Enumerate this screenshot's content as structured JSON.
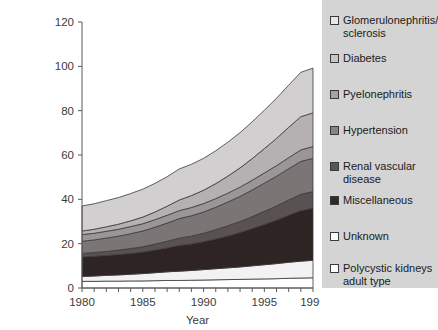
{
  "chart_data": {
    "type": "area",
    "stacked": true,
    "title": "",
    "xlabel": "Year",
    "ylabel": "",
    "xlim": [
      1980,
      1999
    ],
    "ylim": [
      0,
      120
    ],
    "yticks": [
      0,
      20,
      40,
      60,
      80,
      100,
      120
    ],
    "xticks": [
      1980,
      1985,
      1990,
      1995,
      1999
    ],
    "x_minor_ticks_every": 1,
    "grid": false,
    "legend_position": "right",
    "x": [
      1980,
      1981,
      1982,
      1983,
      1984,
      1985,
      1986,
      1987,
      1988,
      1989,
      1990,
      1991,
      1992,
      1993,
      1994,
      1995,
      1996,
      1997,
      1998,
      1999
    ],
    "series": [
      {
        "name": "Polycystic kidneys adult type",
        "color": "#ffffff",
        "values": [
          3.0,
          3.0,
          3.1,
          3.1,
          3.2,
          3.2,
          3.3,
          3.4,
          3.4,
          3.5,
          3.6,
          3.7,
          3.8,
          3.9,
          4.0,
          4.1,
          4.2,
          4.4,
          4.5,
          4.6
        ]
      },
      {
        "name": "Unknown",
        "color": "#f2f2f2",
        "values": [
          2.2,
          2.4,
          2.6,
          2.8,
          3.0,
          3.3,
          3.6,
          3.9,
          4.2,
          4.4,
          4.7,
          5.0,
          5.3,
          5.6,
          6.0,
          6.4,
          6.8,
          7.2,
          7.6,
          7.9
        ]
      },
      {
        "name": "Miscellaneous",
        "color": "#2e2424",
        "values": [
          8.8,
          8.9,
          9.0,
          9.2,
          9.4,
          9.7,
          10.2,
          10.8,
          11.6,
          12.0,
          12.6,
          13.4,
          14.4,
          15.5,
          16.8,
          18.2,
          19.6,
          21.2,
          22.8,
          23.5
        ]
      },
      {
        "name": "Renal vascular disease",
        "color": "#595152",
        "values": [
          1.6,
          1.7,
          1.8,
          2.0,
          2.2,
          2.4,
          2.7,
          3.0,
          3.3,
          3.5,
          3.8,
          4.2,
          4.6,
          5.0,
          5.4,
          5.9,
          6.4,
          6.9,
          7.4,
          7.5
        ]
      },
      {
        "name": "Hypertension",
        "color": "#7c7576",
        "values": [
          5.5,
          5.7,
          6.0,
          6.3,
          6.7,
          7.1,
          7.6,
          8.2,
          8.8,
          9.2,
          9.6,
          10.1,
          10.7,
          11.3,
          12.0,
          12.7,
          13.4,
          14.1,
          14.8,
          15.0
        ]
      },
      {
        "name": "Pyelonephritis",
        "color": "#9a9596",
        "values": [
          3.0,
          3.0,
          3.1,
          3.1,
          3.2,
          3.3,
          3.4,
          3.5,
          3.6,
          3.7,
          3.8,
          3.9,
          4.0,
          4.2,
          4.4,
          4.6,
          4.8,
          5.0,
          5.2,
          5.3
        ]
      },
      {
        "name": "Diabetes",
        "color": "#b5b1b2",
        "values": [
          1.6,
          1.8,
          2.0,
          2.3,
          2.6,
          3.0,
          3.5,
          4.1,
          4.8,
          5.4,
          6.0,
          6.8,
          7.7,
          8.7,
          9.8,
          11.0,
          12.3,
          13.7,
          15.0,
          15.2
        ]
      },
      {
        "name": "Glomerulonephritis/ sclerosis",
        "color": "#d2cfd0",
        "values": [
          11.3,
          11.5,
          11.8,
          12.0,
          12.3,
          12.6,
          12.9,
          13.3,
          14.0,
          14.1,
          14.4,
          14.8,
          15.3,
          15.9,
          16.6,
          17.3,
          18.1,
          19.0,
          20.0,
          20.2
        ]
      }
    ],
    "totals": [
      37.0,
      38.0,
      39.4,
      40.8,
      42.6,
      44.6,
      47.2,
      50.2,
      53.7,
      55.8,
      58.5,
      61.9,
      65.8,
      70.1,
      75.0,
      80.2,
      85.6,
      91.5,
      97.3,
      99.2
    ]
  },
  "axes": {
    "ylabels": [
      "0",
      "20",
      "40",
      "60",
      "80",
      "100",
      "120"
    ],
    "xlabels": [
      "1980",
      "1985",
      "1990",
      "1995",
      "1999"
    ],
    "xtitle": "Year"
  },
  "legend": {
    "items": [
      {
        "label": "Glomerulonephritis/\nsclerosis",
        "color": "#e8e6e6"
      },
      {
        "label": "Diabetes",
        "color": "#c9c6c7"
      },
      {
        "label": "Pyelonephritis",
        "color": "#a7a3a4"
      },
      {
        "label": "Hypertension",
        "color": "#8a8384"
      },
      {
        "label": "Renal vascular\ndisease",
        "color": "#5c5455"
      },
      {
        "label": "Miscellaneous",
        "color": "#332929"
      },
      {
        "label": "Unknown",
        "color": "#fbfbfb"
      },
      {
        "label": "Polycystic kidneys\nadult type",
        "color": "#ffffff"
      }
    ],
    "tops": [
      14,
      52,
      88,
      124,
      160,
      194,
      230,
      262
    ],
    "background": "#d4d4d4"
  }
}
